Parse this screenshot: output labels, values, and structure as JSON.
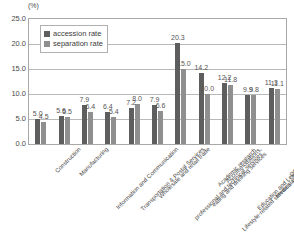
{
  "chart_data": {
    "type": "bar",
    "title": "",
    "subtitle": "",
    "xlabel": "",
    "ylabel": "(%)",
    "ylim": [
      0.0,
      25.0
    ],
    "ytick_step": 5.0,
    "ytick_labels": [
      "0.0",
      "5.0",
      "10.0",
      "15.0",
      "20.0",
      "25.0"
    ],
    "ytick_values": [
      0.0,
      5.0,
      10.0,
      15.0,
      20.0,
      25.0
    ],
    "grid": true,
    "legend_position": "upper-left-inside",
    "categories": [
      "Construction",
      "Manufacturing",
      "Information and Communication",
      "Transportation & Postal Services",
      "Wholesale and retail trade",
      "Academic research, professional and technical services",
      "Accommodations, eating and drinking services",
      "Lifestyle-related services and entertainment",
      "Education and Learning Support",
      "Medical Care and Welfare",
      "Other services"
    ],
    "series": [
      {
        "name": "accession rate",
        "color": "#5e5e5e",
        "values": [
          5.0,
          5.6,
          7.9,
          6.4,
          7.2,
          7.9,
          20.3,
          14.2,
          12.2,
          9.9,
          11.3
        ]
      },
      {
        "name": "separation rate",
        "color": "#8f8f8f",
        "values": [
          4.5,
          5.5,
          6.4,
          5.4,
          8.0,
          6.6,
          15.0,
          10.0,
          11.8,
          9.8,
          11.1
        ]
      }
    ],
    "value_labels": {
      "accession": [
        "5.0",
        "5.6",
        "7.9",
        "6.4",
        "7.2",
        "7.9",
        "20.3",
        "14.2",
        "12.2",
        "9.9",
        "11.3"
      ],
      "separation": [
        "4.5",
        "5.5",
        "6.4",
        "5.4",
        "8.0",
        "6.6",
        "15.0",
        "10.0",
        "11.8",
        "9.8",
        "11.1"
      ]
    }
  },
  "legend": {
    "items": [
      {
        "label": "accession rate"
      },
      {
        "label": "separation rate"
      }
    ]
  },
  "axis": {
    "y_unit": "(%)"
  }
}
